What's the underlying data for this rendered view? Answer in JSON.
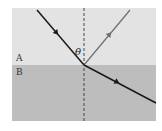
{
  "diagram": {
    "medium_top_label": "A",
    "medium_bottom_label": "B",
    "angle_label": "θ",
    "colors": {
      "medium_a": "#e3e3e3",
      "medium_b": "#bdbdbd",
      "incident_ray": "#1a1a1a",
      "reflected_ray": "#6e6e6e",
      "refracted_ray": "#1a1a1a",
      "normal_line": "#444444"
    }
  }
}
